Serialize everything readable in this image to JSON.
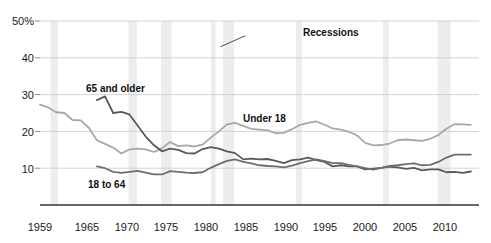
{
  "chart_data": {
    "type": "line",
    "title": "",
    "subtitle": "",
    "xlabel": "",
    "ylabel": "",
    "xlim": [
      1959,
      2013
    ],
    "ylim": [
      0,
      50
    ],
    "grid": true,
    "grid_axis": "y",
    "legend_position": "inline-annotations",
    "y_ticks": [
      "50%",
      "40",
      "30",
      "20",
      "10"
    ],
    "y_tick_values": [
      50,
      40,
      30,
      20,
      10
    ],
    "x_ticks": [
      "1959",
      "1965",
      "1970",
      "1975",
      "1980",
      "1985",
      "1990",
      "1995",
      "2000",
      "2005",
      "2010"
    ],
    "x_tick_values": [
      1959,
      1965,
      1970,
      1975,
      1980,
      1985,
      1990,
      1995,
      2000,
      2005,
      2010
    ],
    "annotations": [
      {
        "text": "Recessions",
        "x": 1984.5,
        "y": 46.0,
        "leader_to_x": 1981.2,
        "leader_to_y": 43.0
      }
    ],
    "shaded_regions_label": "Recessions",
    "shaded_regions": [
      {
        "start": 1960.3,
        "end": 1961.2
      },
      {
        "start": 1969.9,
        "end": 1970.9
      },
      {
        "start": 1973.9,
        "end": 1975.2
      },
      {
        "start": 1980.0,
        "end": 1980.6
      },
      {
        "start": 1981.5,
        "end": 1982.9
      },
      {
        "start": 1990.5,
        "end": 1991.2
      },
      {
        "start": 2001.2,
        "end": 2001.9
      },
      {
        "start": 2007.9,
        "end": 2009.5
      }
    ],
    "series": [
      {
        "name": "Under 18",
        "color": "#a8a8a8",
        "label_x": 1986.5,
        "label_y": 25.5,
        "x": [
          1959,
          1960,
          1961,
          1962,
          1963,
          1964,
          1965,
          1966,
          1967,
          1968,
          1969,
          1970,
          1971,
          1972,
          1973,
          1974,
          1975,
          1976,
          1977,
          1978,
          1979,
          1980,
          1981,
          1982,
          1983,
          1984,
          1985,
          1986,
          1987,
          1988,
          1989,
          1990,
          1991,
          1992,
          1993,
          1994,
          1995,
          1996,
          1997,
          1998,
          1999,
          2000,
          2001,
          2002,
          2003,
          2004,
          2005,
          2006,
          2007,
          2008,
          2009,
          2010,
          2011,
          2012
        ],
        "values": [
          27.3,
          26.5,
          25.2,
          25.0,
          23.1,
          23.0,
          21.0,
          17.6,
          16.6,
          15.6,
          14.0,
          15.1,
          15.3,
          15.1,
          14.4,
          15.4,
          17.1,
          16.0,
          16.2,
          15.9,
          16.4,
          18.3,
          20.0,
          21.9,
          22.3,
          21.5,
          20.7,
          20.5,
          20.3,
          19.5,
          19.6,
          20.6,
          21.8,
          22.3,
          22.7,
          21.8,
          20.8,
          20.5,
          19.9,
          18.9,
          16.9,
          16.2,
          16.3,
          16.7,
          17.6,
          17.8,
          17.6,
          17.4,
          18.0,
          19.0,
          20.7,
          22.0,
          21.9,
          21.8
        ]
      },
      {
        "name": "65 and older",
        "color": "#595959",
        "label_x": 1966.0,
        "label_y": 32.0,
        "x": [
          1966,
          1967,
          1968,
          1969,
          1970,
          1971,
          1972,
          1973,
          1974,
          1975,
          1976,
          1977,
          1978,
          1979,
          1980,
          1981,
          1982,
          1983,
          1984,
          1985,
          1986,
          1987,
          1988,
          1989,
          1990,
          1991,
          1992,
          1993,
          1994,
          1995,
          1996,
          1997,
          1998,
          1999,
          2000,
          2001,
          2002,
          2003,
          2004,
          2005,
          2006,
          2007,
          2008,
          2009,
          2010,
          2011,
          2012
        ],
        "values": [
          28.5,
          29.5,
          25.0,
          25.3,
          24.6,
          21.6,
          18.6,
          16.3,
          14.6,
          15.3,
          15.0,
          14.1,
          14.0,
          15.2,
          15.7,
          15.3,
          14.6,
          14.1,
          12.4,
          12.6,
          12.4,
          12.5,
          12.0,
          11.4,
          12.2,
          12.4,
          12.9,
          12.2,
          11.7,
          10.5,
          10.8,
          10.5,
          10.5,
          9.7,
          9.9,
          10.1,
          10.4,
          10.2,
          9.8,
          10.1,
          9.4,
          9.7,
          9.7,
          8.9,
          9.0,
          8.7,
          9.1
        ]
      },
      {
        "name": "18 to 64",
        "color": "#6e6e6e",
        "label_x": 1967.0,
        "label_y": 6.5,
        "x": [
          1966,
          1967,
          1968,
          1969,
          1970,
          1971,
          1972,
          1973,
          1974,
          1975,
          1976,
          1977,
          1978,
          1979,
          1980,
          1981,
          1982,
          1983,
          1984,
          1985,
          1986,
          1987,
          1988,
          1989,
          1990,
          1991,
          1992,
          1993,
          1994,
          1995,
          1996,
          1997,
          1998,
          1999,
          2000,
          2001,
          2002,
          2003,
          2004,
          2005,
          2006,
          2007,
          2008,
          2009,
          2010,
          2011,
          2012
        ],
        "values": [
          10.5,
          10.0,
          9.0,
          8.7,
          9.0,
          9.3,
          8.8,
          8.3,
          8.3,
          9.2,
          9.0,
          8.8,
          8.7,
          8.9,
          10.1,
          11.1,
          12.0,
          12.4,
          11.7,
          11.3,
          10.8,
          10.6,
          10.5,
          10.2,
          10.7,
          11.4,
          11.9,
          12.4,
          11.9,
          11.4,
          11.4,
          10.9,
          10.5,
          10.0,
          9.6,
          10.1,
          10.6,
          10.8,
          11.1,
          11.3,
          10.8,
          10.9,
          11.7,
          12.9,
          13.7,
          13.7,
          13.7
        ]
      }
    ]
  },
  "axis": {
    "x_axis_line_color": "#333333",
    "grid_color": "#c9c9c9",
    "recession_band_color": "#ededed"
  }
}
